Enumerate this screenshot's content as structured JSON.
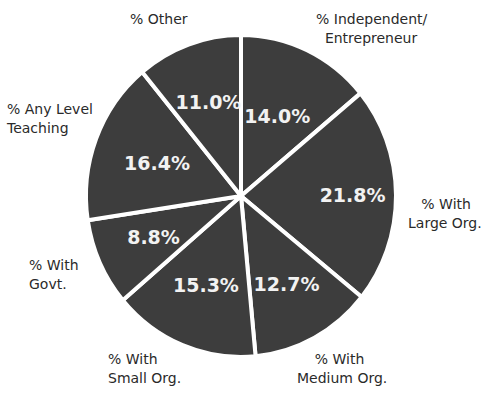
{
  "chart_data": {
    "type": "pie",
    "title": "",
    "start_angle_deg": 0,
    "direction": "clockwise",
    "slice_color": "#3d3d3d",
    "separator_color": "#ffffff",
    "categories": [
      "% Independent/ Entrepreneur",
      "% With Large Org.",
      "% With Medium Org.",
      "% With Small Org.",
      "% With Govt.",
      "% Any Level Teaching",
      "% Other"
    ],
    "values": [
      14.0,
      21.8,
      12.7,
      15.3,
      8.8,
      16.4,
      11.0
    ],
    "value_labels": [
      "14.0%",
      "21.8%",
      "12.7%",
      "15.3%",
      "8.8%",
      "16.4%",
      "11.0%"
    ]
  },
  "labels": {
    "independent": "% Independent/\n  Entrepreneur",
    "large": "   % With\nLarge Org.",
    "medium": "    % With\nMedium Org.",
    "small": "% With\nSmall Org.",
    "govt": "% With\nGovt.",
    "teaching": "% Any Level\nTeaching",
    "other": "% Other"
  }
}
